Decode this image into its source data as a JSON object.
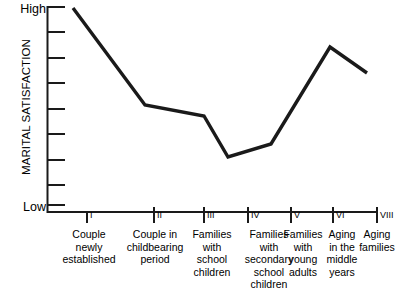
{
  "chart_data": {
    "type": "line",
    "title": "",
    "xlabel": "",
    "ylabel": "MARITAL SATISFACTION",
    "y_axis": {
      "high_label": "High",
      "low_label": "Low",
      "tick_count": 9,
      "ylim_labels": [
        "Low",
        "High"
      ]
    },
    "grid": false,
    "legend": "none",
    "stage_numerals": [
      "I",
      "II",
      "III",
      "IV",
      "V",
      "VI",
      "VIII"
    ],
    "categories": [
      "Couple newly established",
      "Couple in childbearing period",
      "Families with school children",
      "Families with secondary school children",
      "Families with young adults",
      "Aging in the middle years",
      "Aging families"
    ],
    "series": [
      {
        "name": "Marital satisfaction",
        "values": [
          9.0,
          4.6,
          4.1,
          1.9,
          2.6,
          7.2,
          6.1
        ]
      }
    ],
    "ylim": [
      0,
      9.6
    ],
    "annotations": []
  },
  "x_axis_labels": [
    {
      "numeral": "I",
      "lines": [
        "Couple",
        "newly",
        "established"
      ]
    },
    {
      "numeral": "II",
      "lines": [
        "Couple in",
        "childbearing",
        "period"
      ]
    },
    {
      "numeral": "III",
      "lines": [
        "Families",
        "with",
        "school",
        "children"
      ]
    },
    {
      "numeral": "IV",
      "lines": [
        "Families",
        "with",
        "secondary",
        "school",
        "children"
      ]
    },
    {
      "numeral": "V",
      "lines": [
        "Families",
        "with",
        "young",
        "adults"
      ]
    },
    {
      "numeral": "VI",
      "lines": [
        "Aging",
        "in the",
        "middle",
        "years"
      ]
    },
    {
      "numeral": "VIII",
      "lines": [
        "Aging",
        "families"
      ]
    }
  ],
  "colors": {
    "line": "#1a1a1a",
    "axis": "#1a1a1a",
    "background": "#ffffff",
    "text": "#000000"
  }
}
